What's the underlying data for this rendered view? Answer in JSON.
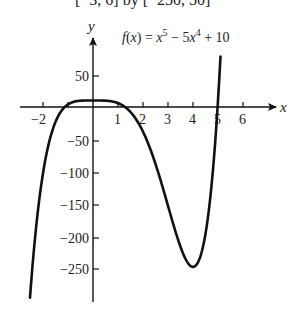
{
  "header": {
    "text": "[−3, 6] by [−250, 50]"
  },
  "chart_data": {
    "type": "line",
    "xlabel": "x",
    "ylabel": "y",
    "x_ticks": [
      -2,
      1,
      2,
      3,
      4,
      5,
      6
    ],
    "x_tick_labels": [
      "−2",
      "1",
      "2",
      "3",
      "4",
      "5",
      "6"
    ],
    "y_ticks": [
      50,
      -50,
      -100,
      -150,
      -200,
      -250
    ],
    "y_tick_labels": [
      "50",
      "−50",
      "−100",
      "−150",
      "−200",
      "−250"
    ],
    "xlim": [
      -2.6,
      6.8
    ],
    "ylim": [
      -300,
      100
    ],
    "grid": false,
    "series": [
      {
        "name": "f(x) = x^5 − 5x^4 + 10",
        "x": [
          -2.52,
          -2,
          -1.5,
          -1,
          -0.5,
          0,
          0.5,
          1,
          1.5,
          2,
          2.5,
          3,
          3.5,
          4,
          4.5,
          5,
          5.1
        ],
        "y": [
          -297,
          -102,
          -22.9,
          4,
          9.66,
          10,
          9.72,
          6,
          -7.7,
          -38,
          -87.6,
          -152,
          -215.1,
          -246,
          -195,
          10,
          92
        ]
      }
    ]
  }
}
